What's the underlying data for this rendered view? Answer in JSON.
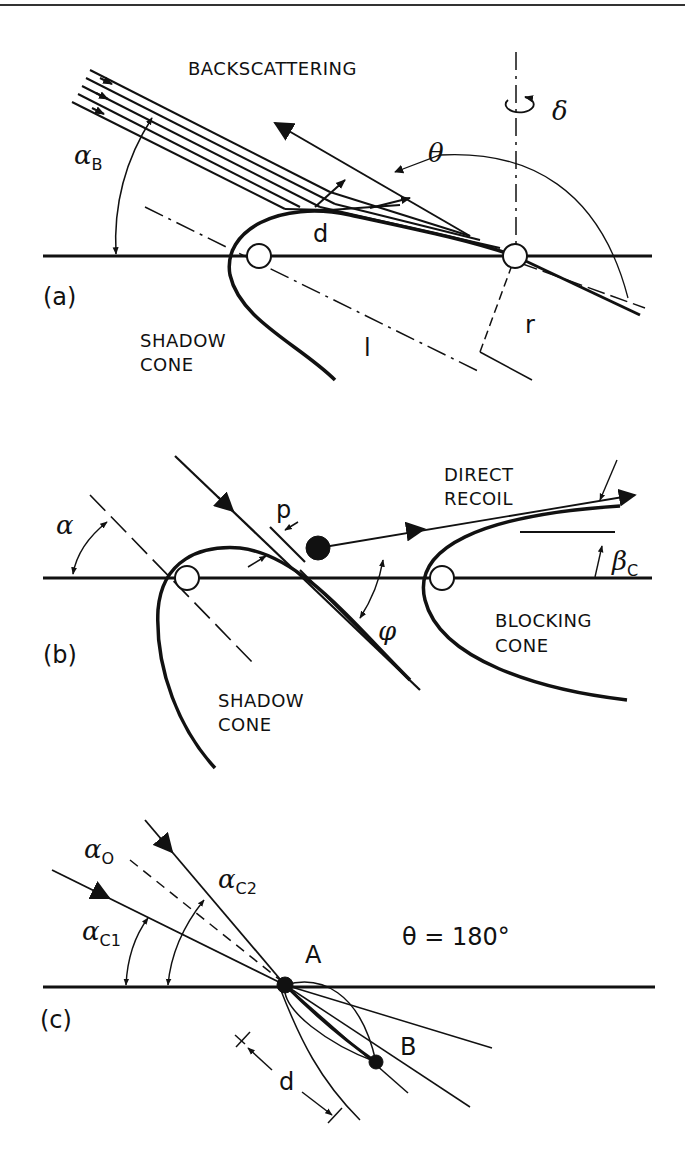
{
  "figure": {
    "header_rule": true,
    "panels": [
      {
        "id": "a",
        "tag": "(a)",
        "labels": {
          "backscattering": "BACKSCATTERING",
          "alpha_b": "α",
          "alpha_b_sub": "B",
          "theta": "θ",
          "delta": "δ",
          "d": "d",
          "r": "r",
          "l": "l",
          "shadow_cone_1": "SHADOW",
          "shadow_cone_2": "CONE"
        }
      },
      {
        "id": "b",
        "tag": "(b)",
        "labels": {
          "alpha": "α",
          "p": "p",
          "phi": "φ",
          "direct_recoil_1": "DIRECT",
          "direct_recoil_2": "RECOIL",
          "beta_c": "β",
          "beta_c_sub": "C",
          "blocking_cone_1": "BLOCKING",
          "blocking_cone_2": "CONE",
          "shadow_cone_1": "SHADOW",
          "shadow_cone_2": "CONE"
        }
      },
      {
        "id": "c",
        "tag": "(c)",
        "labels": {
          "alpha_0": "α",
          "alpha_0_sub": "O",
          "alpha_c2": "α",
          "alpha_c2_sub": "C2",
          "alpha_c1": "α",
          "alpha_c1_sub": "C1",
          "atom_a": "A",
          "atom_b": "B",
          "theta_eq": "θ = 180°",
          "d": "d"
        }
      }
    ],
    "colors": {
      "ink": "#111111",
      "background": "#ffffff"
    }
  }
}
